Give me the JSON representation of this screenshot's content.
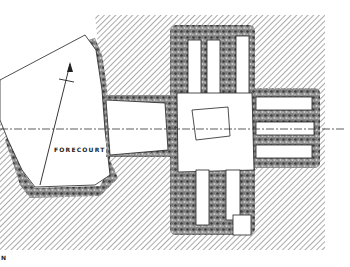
{
  "diagram": {
    "type": "archaeological-plan",
    "labels": {
      "forecourt": "FORECOURT",
      "north": "N"
    },
    "legend": {
      "hatched": "surrounding cairn / natural ground",
      "stippled": "stone walling",
      "white": "open chamber / passage area"
    },
    "axis_line": "dash-dot centre line",
    "colors": {
      "ink": "#222222",
      "hatch": "#555555",
      "stone": "#6b6b6b",
      "background": "#ffffff"
    }
  }
}
